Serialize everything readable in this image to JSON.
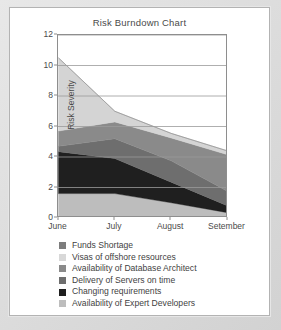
{
  "chart_data": {
    "type": "area",
    "title": "Risk Burndown Chart",
    "xlabel": "",
    "ylabel": "Risk Severity",
    "categories": [
      "June",
      "July",
      "August",
      "Setember"
    ],
    "x_tick_labels": [
      "June",
      "July",
      "August",
      "Setember"
    ],
    "y_tick_labels": [
      "0",
      "2",
      "4",
      "6",
      "8",
      "10",
      "12"
    ],
    "y_ticks": [
      0,
      2,
      4,
      6,
      8,
      10,
      12
    ],
    "ylim": [
      0,
      12
    ],
    "stacked": true,
    "grid": "horizontal",
    "legend_position": "bottom",
    "series": [
      {
        "name": "Funds Shortage",
        "color": "#7d7d7d",
        "values": [
          0.0,
          0.0,
          0.0,
          0.0
        ]
      },
      {
        "name": "Visas of offshore resources",
        "color": "#d4d4d4",
        "values": [
          4.8,
          0.7,
          0.3,
          0.25
        ]
      },
      {
        "name": "Availability of Database Architect",
        "color": "#8a8a8a",
        "values": [
          1.0,
          1.1,
          1.5,
          2.4
        ]
      },
      {
        "name": "Delivery of Servers on time",
        "color": "#6e6e6e",
        "values": [
          0.35,
          1.3,
          1.4,
          0.95
        ]
      },
      {
        "name": "Changing requirements",
        "color": "#1f1f1f",
        "values": [
          2.75,
          2.3,
          1.35,
          0.45
        ]
      },
      {
        "name": "Availability of Expert Developers",
        "color": "#bdbdbd",
        "values": [
          1.6,
          1.6,
          1.0,
          0.35
        ]
      }
    ],
    "cumulative_totals": [
      10.5,
      7.0,
      5.55,
      4.4
    ],
    "stack_order_bottom_to_top": [
      "Availability of Expert Developers",
      "Changing requirements",
      "Delivery of Servers on time",
      "Availability of Database Architect",
      "Visas of offshore resources",
      "Funds Shortage"
    ]
  },
  "legend": {
    "items": [
      {
        "label": "Funds Shortage",
        "color": "#7d7d7d"
      },
      {
        "label": "Visas of offshore resources",
        "color": "#d8d8d8"
      },
      {
        "label": "Availability of Database Architect",
        "color": "#8a8a8a"
      },
      {
        "label": "Delivery of Servers on time",
        "color": "#6e6e6e"
      },
      {
        "label": "Changing requirements",
        "color": "#1f1f1f"
      },
      {
        "label": "Availability of Expert Developers",
        "color": "#bdbdbd"
      }
    ]
  },
  "colors": {
    "axis": "#8e8e8e",
    "grid": "#9a9a9a",
    "text": "#4a4a4a",
    "card_bg": "#ffffff",
    "page_bg": "#d2d2d2"
  }
}
